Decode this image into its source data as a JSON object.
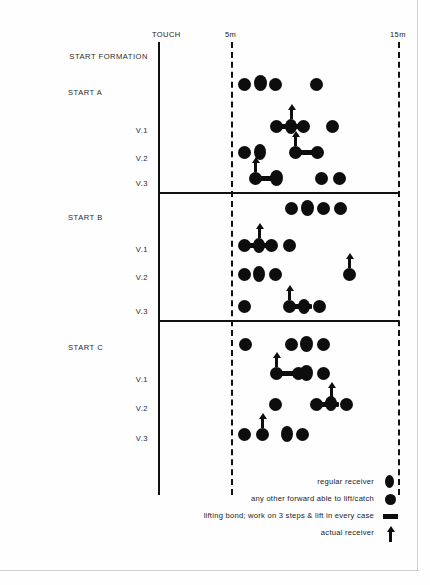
{
  "diagram": {
    "axis": {
      "touch_label": "TOUCH",
      "five_m_label": "5m",
      "fifteen_m_label": "15m",
      "touch_x": 158,
      "five_m_x": 231,
      "fifteen_m_x": 398
    },
    "header_label": "START FORMATION",
    "sections": [
      {
        "name": "START A",
        "rows": [
          {
            "label": "START A",
            "label_align": "left"
          },
          {
            "label": "V.1",
            "label_align": "right"
          },
          {
            "label": "V.2",
            "label_align": "right"
          },
          {
            "label": "V.3",
            "label_align": "right"
          }
        ]
      },
      {
        "name": "START B",
        "rows": [
          {
            "label": "START B",
            "label_align": "left"
          },
          {
            "label": "V.1",
            "label_align": "right"
          },
          {
            "label": "V.2",
            "label_align": "right"
          },
          {
            "label": "V.3",
            "label_align": "right"
          }
        ]
      },
      {
        "name": "START C",
        "rows": [
          {
            "label": "START C",
            "label_align": "left"
          },
          {
            "label": "V.1",
            "label_align": "right"
          },
          {
            "label": "V.2",
            "label_align": "right"
          },
          {
            "label": "V.3",
            "label_align": "right"
          }
        ]
      }
    ],
    "legend": [
      {
        "text": "regular receiver",
        "marker": "oval-dot-icon"
      },
      {
        "text": "any other forward able to lift/catch",
        "marker": "round-dot-icon"
      },
      {
        "text": "lifting bond; work on 3 steps & lift in every case",
        "marker": "bond-bar-icon"
      },
      {
        "text": "actual receiver",
        "marker": "up-arrow-icon"
      }
    ],
    "colors": {
      "ink": "#0d0d0d",
      "line": "#111111",
      "text": "#1a1a1a",
      "page_border": "#cfcfcf",
      "background": "#ffffff"
    }
  }
}
